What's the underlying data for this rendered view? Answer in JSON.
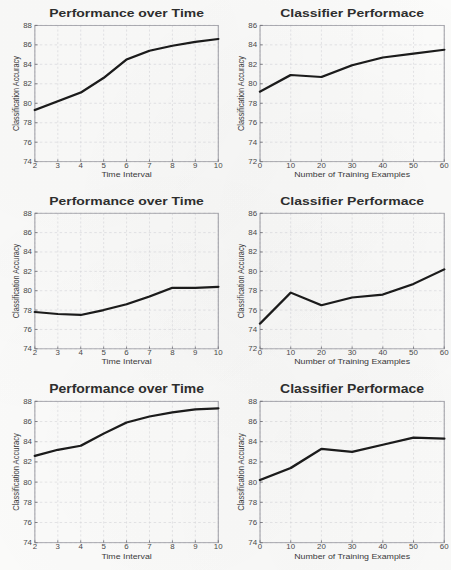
{
  "figure": {
    "background_color": "#fbfbfa",
    "line_color": "#1b1b1b",
    "grid_color": "#d9d9dd",
    "frame_color": "#9a9aa2",
    "panel_count": 6,
    "layout": "3 rows x 2 columns"
  },
  "chart_data": [
    {
      "id": "panel-1",
      "type": "line",
      "title": "Performance over Time",
      "xlabel": "Time Interval",
      "ylabel": "Classification Accuracy",
      "grid": true,
      "legend": "none",
      "xlim": [
        2,
        10
      ],
      "ylim": [
        74,
        88
      ],
      "xticks": [
        2,
        3,
        4,
        5,
        6,
        7,
        8,
        9,
        10
      ],
      "yticks": [
        74,
        76,
        78,
        80,
        82,
        84,
        86,
        88
      ],
      "x": [
        2,
        3,
        4,
        5,
        6,
        7,
        8,
        9,
        10
      ],
      "values": [
        79.3,
        80.2,
        81.1,
        82.6,
        84.5,
        85.4,
        85.9,
        86.3,
        86.6
      ]
    },
    {
      "id": "panel-2",
      "type": "line",
      "title": "Classifier Performace",
      "xlabel": "Number of Training Examples",
      "ylabel": "Classification Accuracy",
      "grid": true,
      "legend": "none",
      "xlim": [
        0,
        60
      ],
      "ylim": [
        72,
        86
      ],
      "xticks": [
        0,
        10,
        20,
        30,
        40,
        50,
        60
      ],
      "yticks": [
        72,
        74,
        76,
        78,
        80,
        82,
        84,
        86
      ],
      "x": [
        0,
        10,
        20,
        30,
        40,
        50,
        60
      ],
      "values": [
        79.2,
        80.9,
        80.7,
        81.9,
        82.7,
        83.1,
        83.5
      ]
    },
    {
      "id": "panel-3",
      "type": "line",
      "title": "Performance over Time",
      "xlabel": "Time Interval",
      "ylabel": "Classification Accuracy",
      "grid": true,
      "legend": "none",
      "xlim": [
        2,
        10
      ],
      "ylim": [
        74,
        88
      ],
      "xticks": [
        2,
        3,
        4,
        5,
        6,
        7,
        8,
        9,
        10
      ],
      "yticks": [
        74,
        76,
        78,
        80,
        82,
        84,
        86,
        88
      ],
      "x": [
        2,
        3,
        4,
        5,
        6,
        7,
        8,
        9,
        10
      ],
      "values": [
        77.8,
        77.6,
        77.5,
        78.0,
        78.6,
        79.4,
        80.3,
        80.3,
        80.4
      ]
    },
    {
      "id": "panel-4",
      "type": "line",
      "title": "Classifier Performace",
      "xlabel": "Number of Training Examples",
      "ylabel": "Classification Accuracy",
      "grid": true,
      "legend": "none",
      "xlim": [
        0,
        60
      ],
      "ylim": [
        72,
        86
      ],
      "xticks": [
        0,
        10,
        20,
        30,
        40,
        50,
        60
      ],
      "yticks": [
        72,
        74,
        76,
        78,
        80,
        82,
        84,
        86
      ],
      "x": [
        0,
        10,
        20,
        30,
        40,
        50,
        60
      ],
      "values": [
        74.6,
        77.8,
        76.5,
        77.3,
        77.6,
        78.7,
        80.2
      ]
    },
    {
      "id": "panel-5",
      "type": "line",
      "title": "Performance over Time",
      "xlabel": "Time Interval",
      "ylabel": "Classification Accuracy",
      "grid": true,
      "legend": "none",
      "xlim": [
        2,
        10
      ],
      "ylim": [
        74,
        88
      ],
      "xticks": [
        2,
        3,
        4,
        5,
        6,
        7,
        8,
        9,
        10
      ],
      "yticks": [
        74,
        76,
        78,
        80,
        82,
        84,
        86,
        88
      ],
      "x": [
        2,
        3,
        4,
        5,
        6,
        7,
        8,
        9,
        10
      ],
      "values": [
        82.6,
        83.2,
        83.6,
        84.8,
        85.9,
        86.5,
        86.9,
        87.2,
        87.3
      ]
    },
    {
      "id": "panel-6",
      "type": "line",
      "title": "Classifier Performace",
      "xlabel": "Number of Training Examples",
      "ylabel": "Classification Accuracy",
      "grid": true,
      "legend": "none",
      "xlim": [
        0,
        60
      ],
      "ylim": [
        74,
        88
      ],
      "xticks": [
        0,
        10,
        20,
        30,
        40,
        50,
        60
      ],
      "yticks": [
        74,
        76,
        78,
        80,
        82,
        84,
        86,
        88
      ],
      "x": [
        0,
        10,
        20,
        30,
        40,
        50,
        60
      ],
      "values": [
        80.2,
        81.4,
        83.3,
        83.0,
        83.7,
        84.4,
        84.3
      ]
    }
  ]
}
